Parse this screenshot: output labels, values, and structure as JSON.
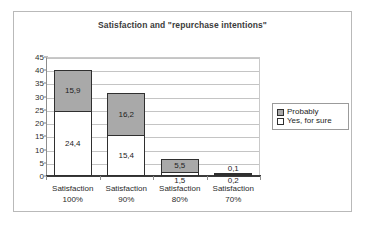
{
  "chart_data": {
    "type": "bar",
    "subtype": "stacked-bar",
    "title": "Satisfaction and \"repurchase intentions\"",
    "xlabel": "",
    "ylabel": "",
    "ylim": [
      0,
      45
    ],
    "ytick_step": 5,
    "yticks": [
      45,
      40,
      35,
      30,
      25,
      20,
      15,
      10,
      5,
      0
    ],
    "grid": true,
    "legend_position": "right",
    "categories": [
      {
        "line1": "Satisfaction",
        "line2": "100%"
      },
      {
        "line1": "Satisfaction",
        "line2": "90%"
      },
      {
        "line1": "Satisfaction",
        "line2": "80%"
      },
      {
        "line1": "Satisfaction",
        "line2": "70%"
      }
    ],
    "series": [
      {
        "name": "Yes, for sure",
        "color": "#ffffff",
        "values": [
          24.4,
          15.4,
          1.5,
          0.2
        ],
        "labels": [
          "24,4",
          "15,4",
          "1,5",
          "0,2"
        ]
      },
      {
        "name": "Probably",
        "color": "#a9a9a9",
        "values": [
          15.9,
          16.2,
          5.5,
          0.1
        ],
        "labels": [
          "15,9",
          "16,2",
          "5,5",
          "0,1"
        ]
      }
    ],
    "totals": [
      40.3,
      31.6,
      7.0,
      0.3
    ]
  },
  "legend": {
    "items": [
      {
        "label": "Probably",
        "color": "#a9a9a9"
      },
      {
        "label": "Yes, for sure",
        "color": "#ffffff"
      }
    ]
  }
}
